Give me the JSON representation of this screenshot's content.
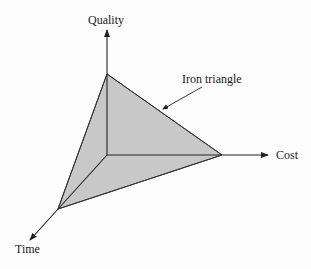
{
  "diagram": {
    "axes": {
      "quality": "Quality",
      "cost": "Cost",
      "time": "Time"
    },
    "callout": "Iron triangle",
    "colors": {
      "fill": "#c8c8c8",
      "stroke": "#222222"
    }
  }
}
